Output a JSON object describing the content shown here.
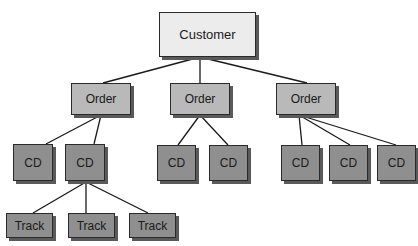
{
  "diagram": {
    "type": "hierarchy-tree",
    "colors": {
      "root_fill": "#ececec",
      "order_fill": "#b9b9b9",
      "leaf_fill": "#8f8f8f",
      "border": "#2a2a2a",
      "shadow": "#5a5a5a",
      "edge": "#1a1a1a"
    },
    "nodes": [
      {
        "id": "customer",
        "label": "Customer",
        "level": "root",
        "x": 159,
        "y": 12,
        "w": 97,
        "h": 45
      },
      {
        "id": "order1",
        "label": "Order",
        "level": "order",
        "x": 71,
        "y": 83,
        "w": 60,
        "h": 32
      },
      {
        "id": "order2",
        "label": "Order",
        "level": "order",
        "x": 170,
        "y": 83,
        "w": 60,
        "h": 32
      },
      {
        "id": "order3",
        "label": "Order",
        "level": "order",
        "x": 276,
        "y": 83,
        "w": 60,
        "h": 32
      },
      {
        "id": "cd1",
        "label": "CD",
        "level": "cd",
        "x": 13,
        "y": 144,
        "w": 40,
        "h": 37
      },
      {
        "id": "cd2",
        "label": "CD",
        "level": "cd",
        "x": 65,
        "y": 144,
        "w": 40,
        "h": 37
      },
      {
        "id": "cd3",
        "label": "CD",
        "level": "cd",
        "x": 157,
        "y": 145,
        "w": 39,
        "h": 36
      },
      {
        "id": "cd4",
        "label": "CD",
        "level": "cd",
        "x": 209,
        "y": 145,
        "w": 39,
        "h": 36
      },
      {
        "id": "cd5",
        "label": "CD",
        "level": "cd",
        "x": 281,
        "y": 145,
        "w": 39,
        "h": 36
      },
      {
        "id": "cd6",
        "label": "CD",
        "level": "cd",
        "x": 329,
        "y": 145,
        "w": 39,
        "h": 36
      },
      {
        "id": "cd7",
        "label": "CD",
        "level": "cd",
        "x": 377,
        "y": 145,
        "w": 39,
        "h": 36
      },
      {
        "id": "track1",
        "label": "Track",
        "level": "track",
        "x": 6,
        "y": 213,
        "w": 47,
        "h": 25
      },
      {
        "id": "track2",
        "label": "Track",
        "level": "track",
        "x": 68,
        "y": 213,
        "w": 47,
        "h": 25
      },
      {
        "id": "track3",
        "label": "Track",
        "level": "track",
        "x": 129,
        "y": 213,
        "w": 47,
        "h": 25
      }
    ],
    "edges": [
      {
        "from": "customer",
        "to": "order1",
        "x1": 200,
        "y1": 57,
        "x2": 103,
        "y2": 83
      },
      {
        "from": "customer",
        "to": "order2",
        "x1": 200,
        "y1": 57,
        "x2": 200,
        "y2": 83
      },
      {
        "from": "customer",
        "to": "order3",
        "x1": 200,
        "y1": 57,
        "x2": 307,
        "y2": 83
      },
      {
        "from": "order1",
        "to": "cd1",
        "x1": 101,
        "y1": 115,
        "x2": 46,
        "y2": 144
      },
      {
        "from": "order1",
        "to": "cd2",
        "x1": 101,
        "y1": 115,
        "x2": 94,
        "y2": 144
      },
      {
        "from": "order2",
        "to": "cd3",
        "x1": 200,
        "y1": 115,
        "x2": 178,
        "y2": 145
      },
      {
        "from": "order2",
        "to": "cd4",
        "x1": 200,
        "y1": 115,
        "x2": 228,
        "y2": 145
      },
      {
        "from": "order3",
        "to": "cd5",
        "x1": 299,
        "y1": 115,
        "x2": 302,
        "y2": 145
      },
      {
        "from": "order3",
        "to": "cd6",
        "x1": 299,
        "y1": 115,
        "x2": 350,
        "y2": 145
      },
      {
        "from": "order3",
        "to": "cd7",
        "x1": 299,
        "y1": 115,
        "x2": 396,
        "y2": 145
      },
      {
        "from": "cd2",
        "to": "track1",
        "x1": 86,
        "y1": 182,
        "x2": 33,
        "y2": 213
      },
      {
        "from": "cd2",
        "to": "track2",
        "x1": 86,
        "y1": 182,
        "x2": 86,
        "y2": 213
      },
      {
        "from": "cd2",
        "to": "track3",
        "x1": 86,
        "y1": 182,
        "x2": 148,
        "y2": 213
      }
    ]
  }
}
